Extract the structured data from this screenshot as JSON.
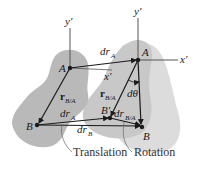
{
  "diagram": {
    "colors": {
      "body_fill_left": "#b9b9b9",
      "body_fill_mid": "#c8c8c8",
      "body_fill_right": "#dcdcdc",
      "line": "#1a1a1a",
      "axis": "#555555"
    },
    "labels": {
      "y_prime_left": "y′",
      "y_prime_right": "y′",
      "x_prime_mid": "x′",
      "x_prime_right": "x′",
      "point_A_left": "A",
      "point_A_right": "A",
      "point_B_left": "B",
      "point_B_prime": "B′",
      "point_B_right": "B",
      "dtheta": "dθ",
      "dr_A_top": {
        "main": "dr",
        "sub": "A"
      },
      "dr_A_bottom": {
        "main": "dr",
        "sub": "A"
      },
      "dr_B": {
        "main": "dr",
        "sub": "B"
      },
      "dr_B_A": {
        "main": "dr",
        "sub": "B/A"
      },
      "r_B_A_left": {
        "main": "r",
        "sub": "B/A"
      },
      "r_B_A_mid": {
        "main": "r",
        "sub": "B/A"
      }
    },
    "captions": {
      "translation": "Translation",
      "rotation": "Rotation"
    }
  }
}
